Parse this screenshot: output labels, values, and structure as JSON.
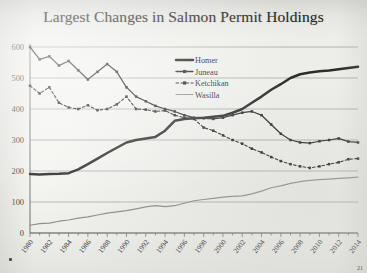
{
  "title": "Largest Changes in Salmon Permit Holdings",
  "page_marker": "21",
  "axis": {
    "y_ticks": [
      0,
      100,
      200,
      300,
      400,
      500,
      600
    ],
    "y_min": 0,
    "y_max": 600,
    "x_ticks": [
      "1980",
      "1982",
      "1984",
      "1986",
      "1988",
      "1990",
      "1992",
      "1994",
      "1996",
      "1998",
      "2000",
      "2002",
      "2004",
      "2006",
      "2008",
      "2010",
      "2012",
      "2014"
    ]
  },
  "legend": {
    "position": "top-center",
    "items": [
      {
        "label": "Homer",
        "style": "thick-solid",
        "color": "#20201e"
      },
      {
        "label": "Juneau",
        "style": "solid-marker",
        "color": "#232321"
      },
      {
        "label": "Ketchikan",
        "style": "dotted-marker",
        "color": "#1d1d1b"
      },
      {
        "label": "Wasilla",
        "style": "thin-solid",
        "color": "#8d8d8d"
      }
    ]
  },
  "chart_data": {
    "type": "line",
    "title": "Largest Changes in Salmon Permit Holdings",
    "xlabel": "",
    "ylabel": "",
    "ylim": [
      0,
      600
    ],
    "xlim": [
      1980,
      2014
    ],
    "grid": true,
    "legend_position": "top-center",
    "x": [
      1980,
      1981,
      1982,
      1983,
      1984,
      1985,
      1986,
      1987,
      1988,
      1989,
      1990,
      1991,
      1992,
      1993,
      1994,
      1995,
      1996,
      1997,
      1998,
      1999,
      2000,
      2001,
      2002,
      2003,
      2004,
      2005,
      2006,
      2007,
      2008,
      2009,
      2010,
      2011,
      2012,
      2013,
      2014
    ],
    "series": [
      {
        "name": "Homer",
        "style": "thick-solid",
        "color": "#20201e",
        "values": [
          190,
          189,
          190,
          191,
          193,
          205,
          222,
          240,
          258,
          275,
          292,
          300,
          305,
          310,
          330,
          362,
          368,
          370,
          372,
          375,
          378,
          388,
          400,
          420,
          440,
          462,
          480,
          500,
          512,
          518,
          522,
          524,
          528,
          532,
          536
        ]
      },
      {
        "name": "Juneau",
        "style": "solid-marker",
        "color": "#232321",
        "values": [
          600,
          560,
          570,
          540,
          555,
          525,
          495,
          520,
          545,
          520,
          470,
          440,
          425,
          410,
          400,
          392,
          380,
          372,
          370,
          368,
          372,
          380,
          388,
          392,
          380,
          350,
          320,
          300,
          292,
          290,
          296,
          300,
          305,
          295,
          292
        ]
      },
      {
        "name": "Ketchikan",
        "style": "dotted-marker",
        "color": "#1d1d1b",
        "values": [
          475,
          450,
          470,
          420,
          405,
          400,
          412,
          396,
          400,
          415,
          440,
          400,
          398,
          392,
          395,
          380,
          372,
          368,
          340,
          330,
          315,
          300,
          288,
          272,
          260,
          245,
          232,
          222,
          215,
          210,
          215,
          222,
          228,
          238,
          240
        ]
      },
      {
        "name": "Wasilla",
        "style": "thin-solid",
        "color": "#8d8d8d",
        "values": [
          25,
          30,
          32,
          38,
          42,
          48,
          52,
          58,
          64,
          68,
          72,
          78,
          84,
          88,
          85,
          88,
          96,
          104,
          108,
          112,
          116,
          118,
          120,
          126,
          135,
          146,
          152,
          160,
          166,
          170,
          172,
          174,
          176,
          178,
          180
        ]
      }
    ]
  }
}
